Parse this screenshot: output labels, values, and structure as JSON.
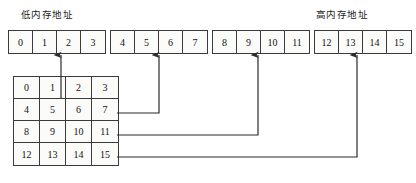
{
  "diagram": {
    "labels": {
      "low_address": "低内存地址",
      "high_address": "高内存地址"
    },
    "colors": {
      "border": "#3a3a3a",
      "cell_background": "#fbfbf9",
      "text": "#111111",
      "connector": "#2b2b2b",
      "page_background": "#ffffff"
    },
    "memory_strip": {
      "total_cells": 16,
      "groups": [
        {
          "cells": [
            "0",
            "1",
            "2",
            "3"
          ]
        },
        {
          "cells": [
            "4",
            "5",
            "6",
            "7"
          ]
        },
        {
          "cells": [
            "8",
            "9",
            "10",
            "11"
          ]
        },
        {
          "cells": [
            "12",
            "13",
            "14",
            "15"
          ]
        }
      ]
    },
    "matrix": {
      "rows": 4,
      "cols": 4,
      "values": [
        [
          "0",
          "1",
          "2",
          "3"
        ],
        [
          "4",
          "5",
          "6",
          "7"
        ],
        [
          "8",
          "9",
          "10",
          "11"
        ],
        [
          "12",
          "13",
          "14",
          "15"
        ]
      ]
    },
    "connectors": [
      {
        "name": "row-1-to-strip",
        "from_cell": "3",
        "to_boundary_after": "1",
        "arrow_x": 61,
        "exit_y": 98
      },
      {
        "name": "row-2-to-strip",
        "from_cell": "7",
        "to_boundary_after": "5",
        "arrow_x": 159,
        "exit_y": 113
      },
      {
        "name": "row-3-to-strip",
        "from_cell": "11",
        "to_boundary_after": "9",
        "arrow_x": 258,
        "exit_y": 135
      },
      {
        "name": "row-4-to-strip",
        "from_cell": "15",
        "to_boundary_after": "13",
        "arrow_x": 357,
        "exit_y": 157
      }
    ]
  }
}
